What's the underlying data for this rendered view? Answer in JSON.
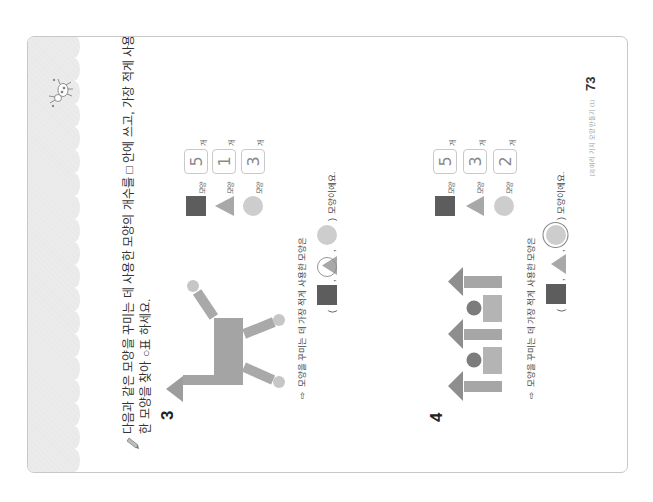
{
  "page": {
    "footer_label": "[3] 여러 가지 모양 만들기 (1)",
    "number": "73"
  },
  "instruction": {
    "icon": "pencil-icon",
    "line1": "다음과 같은 모양을 꾸미는 데 사용한 모양의 개수를 □ 안에 쓰고, 가장 적게 사용",
    "line2": "한 모양을 찾아 ○표 하세요."
  },
  "problems": [
    {
      "number": "3",
      "counts": [
        {
          "shape": "square",
          "label": "모양",
          "value": "5",
          "unit": "개"
        },
        {
          "shape": "triangle",
          "label": "모양",
          "value": "1",
          "unit": "개"
        },
        {
          "shape": "circle",
          "label": "모양",
          "value": "3",
          "unit": "개"
        }
      ],
      "answer": {
        "arrow": "⇨",
        "prompt": "모양을 꾸미는 데 가장 적게 사용한 모양은",
        "open": "(",
        "separator": ",",
        "close": ")",
        "suffix": "모양이에요.",
        "options": [
          "square",
          "triangle",
          "circle"
        ],
        "circled": "triangle"
      }
    },
    {
      "number": "4",
      "counts": [
        {
          "shape": "square",
          "label": "모양",
          "value": "5",
          "unit": "개"
        },
        {
          "shape": "triangle",
          "label": "모양",
          "value": "3",
          "unit": "개"
        },
        {
          "shape": "circle",
          "label": "모양",
          "value": "2",
          "unit": "개"
        }
      ],
      "answer": {
        "arrow": "⇨",
        "prompt": "모양을 꾸미는 데 가장 적게 사용한 모양은",
        "open": "(",
        "separator": ",",
        "close": ")",
        "suffix": "모양이에요.",
        "options": [
          "square",
          "triangle",
          "circle"
        ],
        "circled": "circle"
      }
    }
  ],
  "colors": {
    "band": "#ebebeb",
    "band_texture": "#e0e0e0",
    "square": "#5d5d5d",
    "triangle": "#a8a8a8",
    "circle": "#cdcdcd",
    "fig3_head": "#9d9d9d",
    "fig3_body": "#a4a4a4",
    "fig3_limb": "#a9a9a9",
    "fig3_ball": "#c6c6c6",
    "fig4_triangle": "#8e8e8e",
    "fig4_pillar": "#a6a6a6",
    "fig4_block": "#b4b4b4",
    "fig4_circle": "#7c7c7c",
    "mark": "#8a8a8a",
    "icon_stroke": "#777777"
  }
}
